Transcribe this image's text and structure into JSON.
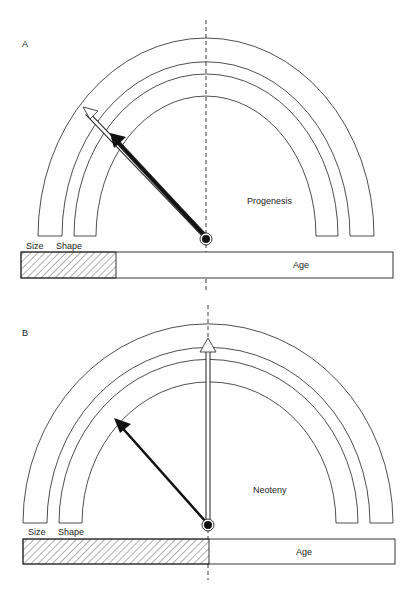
{
  "panels": [
    {
      "letter": "A",
      "title": "Progenesis",
      "arc_labels": {
        "size": "Size",
        "shape": "Shape"
      },
      "bar_label": "Age",
      "size_arrow": "white, truncated before outer arc",
      "shape_arrow": "black, truncated before inner arc",
      "hatched_fraction": 0.25
    },
    {
      "letter": "B",
      "title": "Neoteny",
      "arc_labels": {
        "size": "Size",
        "shape": "Shape"
      },
      "bar_label": "Age",
      "size_arrow": "white, vertical to normal",
      "shape_arrow": "black, retarded angle",
      "hatched_fraction": 0.5
    }
  ],
  "colors": {
    "line": "#222222",
    "background": "#ffffff"
  }
}
